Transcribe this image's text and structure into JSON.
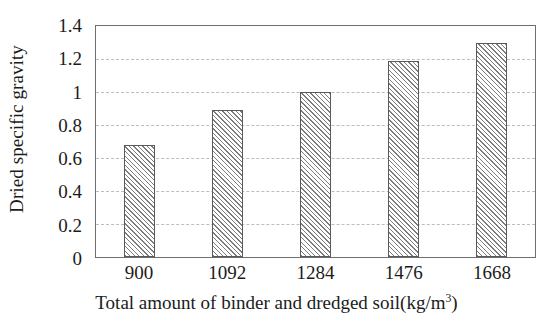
{
  "chart_data": {
    "type": "bar",
    "title": "",
    "categories": [
      "900",
      "1092",
      "1284",
      "1476",
      "1668"
    ],
    "values": [
      0.68,
      0.89,
      1.0,
      1.19,
      1.3
    ],
    "series": [
      {
        "name": "Dried specific gravity",
        "values": [
          0.68,
          0.89,
          1.0,
          1.19,
          1.3
        ]
      }
    ],
    "xlabel_main": "Total amount of binder and dredged soil(kg/m",
    "xlabel_sup": "3",
    "xlabel_tail": ")",
    "xlabel_full": "Total amount of binder and dredged soil(kg/m3)",
    "ylabel": "Dried specific gravity",
    "ylim": [
      0,
      1.4
    ],
    "yticks": [
      "0",
      "0.2",
      "0.4",
      "0.6",
      "0.8",
      "1",
      "1.2",
      "1.4"
    ],
    "ytick_values": [
      0,
      0.2,
      0.4,
      0.6,
      0.8,
      1.0,
      1.2,
      1.4
    ],
    "grid": "horizontal-dashed",
    "legend": "none",
    "bar_fill": "#ffffff",
    "bar_hatch_color": "#7d7d7d",
    "bar_border_color": "#5a5a5a",
    "gridline_color": "#bdbdbd",
    "frame_color": "#6e6e6e",
    "text_color": "#1b1b1b",
    "background": "#ffffff"
  }
}
